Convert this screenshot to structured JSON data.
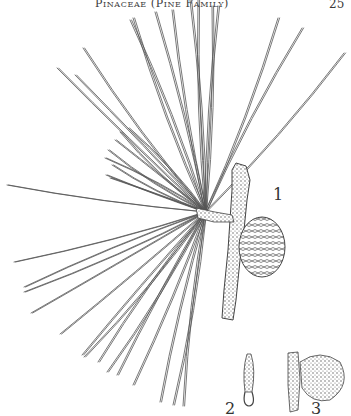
{
  "header": {
    "running_head": "Pinaceae (Pine Family)",
    "page_number": "25"
  },
  "figure": {
    "labels": [
      {
        "id": "1",
        "text": "1",
        "depicts": "branch with needle fascicles and cone"
      },
      {
        "id": "2",
        "text": "2",
        "depicts": "staminate cone detail"
      },
      {
        "id": "3",
        "text": "3",
        "depicts": "ovulate cone on twig detail"
      }
    ],
    "ink_color": "#4a4a4a",
    "paper_color": "#ffffff"
  }
}
